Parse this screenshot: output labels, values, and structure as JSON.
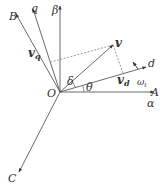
{
  "diagram": {
    "title": "",
    "origin": {
      "label": "O",
      "x": 60,
      "y": 92
    },
    "axes": [
      {
        "id": "beta",
        "label": "β",
        "x2": 60,
        "y2": 6,
        "lx": 52,
        "ly": 14
      },
      {
        "id": "A",
        "label": "A",
        "x2": 154,
        "y2": 92,
        "lx": 152,
        "ly": 97
      },
      {
        "id": "alpha",
        "label": "α",
        "lx": 148,
        "ly": 107
      },
      {
        "id": "B",
        "label": "B",
        "x2": 16,
        "y2": 14,
        "lx": 8,
        "ly": 20
      },
      {
        "id": "q",
        "label": "q",
        "x2": 33,
        "y2": 9,
        "lx": 31,
        "ly": 13
      },
      {
        "id": "C",
        "label": "C",
        "x2": 19,
        "y2": 172,
        "lx": 8,
        "ly": 182
      },
      {
        "id": "d",
        "label": "d",
        "x2": 146,
        "y2": 67,
        "lx": 148,
        "ly": 67
      }
    ],
    "vector": {
      "label": "v",
      "x2": 113,
      "y2": 45,
      "lx": 115,
      "ly": 48
    },
    "components": {
      "vd_label": "v",
      "vd_sub": "d",
      "vq_label": "v",
      "vq_sub": "q"
    },
    "angles": {
      "delta": "δ",
      "theta": "θ"
    },
    "rotation": {
      "label": "ω",
      "sub": "t"
    },
    "colors": {
      "line": "#444444",
      "dashed": "#555555",
      "text": "#333333",
      "background": "#ffffff"
    }
  }
}
